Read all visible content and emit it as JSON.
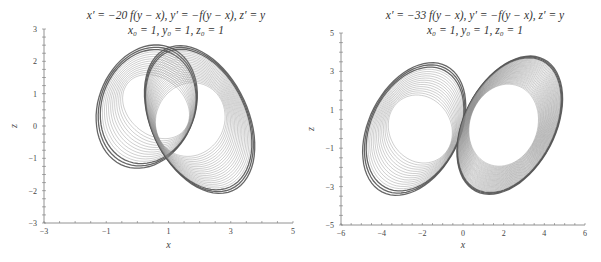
{
  "chart_data": [
    {
      "type": "line",
      "title_line1": "x′ = −20 f(y − x),    y′ = −f(y − x),    z′ = y",
      "title_line2": "x₀ = 1,  y₀ = 1,  z₀ = 1",
      "xlabel": "x",
      "ylabel": "z",
      "xlim": [
        -3,
        5
      ],
      "ylim": [
        -3,
        3
      ],
      "xticks": [
        -3,
        -1,
        1,
        3,
        5
      ],
      "yticks": [
        -3,
        -2,
        -1,
        0,
        1,
        2,
        3
      ],
      "grid": false,
      "legend": null,
      "description": "Chaotic attractor trajectory in x–z plane forming two interlocking lobes (heart/butterfly shape)",
      "series": [
        {
          "name": "trajectory",
          "color": "#555555",
          "lobes": [
            {
              "cx": 0.3,
              "cz": 0.6,
              "rx": 1.6,
              "rz": 2.1,
              "angle": -35,
              "loops": 14
            },
            {
              "cx": 2.0,
              "cz": 0.2,
              "rx": 1.6,
              "rz": 2.6,
              "angle": 35,
              "loops": 22
            }
          ]
        }
      ]
    },
    {
      "type": "line",
      "title_line1": "x′ = −33 f(y − x),    y′ = −f(y − x),    z′ = y",
      "title_line2": "x₀ = 1,  y₀ = 1,  z₀ = 1",
      "xlabel": "x",
      "ylabel": "z",
      "xlim": [
        -6,
        6
      ],
      "ylim": [
        -5,
        5
      ],
      "xticks": [
        -6,
        -4,
        -2,
        0,
        2,
        4,
        6
      ],
      "yticks": [
        -5,
        -3,
        -1,
        1,
        3,
        5
      ],
      "grid": false,
      "legend": null,
      "description": "Chaotic attractor trajectory in x–z plane forming two tilted elliptical lobes, right lobe with hollow center",
      "series": [
        {
          "name": "trajectory",
          "color": "#555555",
          "lobes": [
            {
              "cx": -2.4,
              "cz": 0.0,
              "rx": 2.3,
              "rz": 4.0,
              "angle": -38,
              "loops": 16
            },
            {
              "cx": 2.3,
              "cz": 0.2,
              "rx": 2.3,
              "rz": 4.2,
              "angle": -38,
              "loops": 34
            }
          ]
        }
      ]
    }
  ]
}
